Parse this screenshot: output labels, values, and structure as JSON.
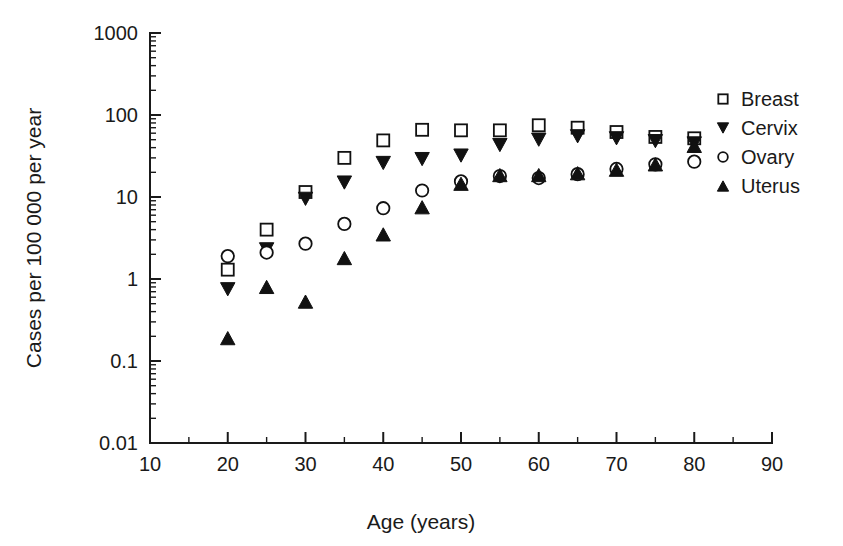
{
  "chart_data": {
    "type": "scatter",
    "title": "",
    "xlabel": "Age (years)",
    "ylabel": "Cases per 100 000 per year",
    "xlim": [
      10,
      90
    ],
    "ylim": [
      0.01,
      1000
    ],
    "yscale": "log",
    "xscale": "linear",
    "grid": false,
    "legend_position": "right",
    "x_ticks": [
      10,
      20,
      30,
      40,
      50,
      60,
      70,
      80,
      90
    ],
    "x_tick_labels": [
      "10",
      "20",
      "30",
      "40",
      "50",
      "60",
      "70",
      "80",
      "90"
    ],
    "x_minor_tick_step": 5,
    "y_ticks": [
      0.01,
      0.1,
      1,
      10,
      100,
      1000
    ],
    "y_tick_labels": [
      "0.01",
      "0.1",
      "1",
      "10",
      "100",
      "1000"
    ],
    "x": [
      20,
      25,
      30,
      35,
      40,
      45,
      50,
      55,
      60,
      65,
      70,
      75,
      80
    ],
    "series": [
      {
        "name": "Breast",
        "marker": "open-square",
        "color": "#111111",
        "values": [
          1.3,
          4.0,
          11.5,
          30.0,
          49.0,
          66.0,
          65.0,
          65.0,
          75.0,
          70.0,
          62.0,
          54.0,
          52.0
        ]
      },
      {
        "name": "Cervix",
        "marker": "filled-down-triangle",
        "color": "#111111",
        "values": [
          0.75,
          2.3,
          9.5,
          15.0,
          26.0,
          29.0,
          32.0,
          43.0,
          50.0,
          55.0,
          52.0,
          48.0,
          45.0
        ]
      },
      {
        "name": "Ovary",
        "marker": "open-circle",
        "color": "#111111",
        "values": [
          1.9,
          2.1,
          2.7,
          4.7,
          7.3,
          12.0,
          15.5,
          18.0,
          17.0,
          19.0,
          22.0,
          25.0,
          27.0
        ]
      },
      {
        "name": "Uterus",
        "marker": "filled-up-triangle",
        "color": "#111111",
        "values": [
          0.19,
          0.8,
          0.53,
          1.8,
          3.5,
          7.5,
          14.5,
          18.5,
          18.5,
          19.5,
          21.5,
          25.0,
          42.0
        ]
      }
    ]
  },
  "legend": {
    "entries": [
      {
        "label": "Breast",
        "marker": "open-square"
      },
      {
        "label": "Cervix",
        "marker": "filled-down-triangle"
      },
      {
        "label": "Ovary",
        "marker": "open-circle"
      },
      {
        "label": "Uterus",
        "marker": "filled-up-triangle"
      }
    ]
  },
  "axes": {
    "x_title": "Age (years)",
    "y_title": "Cases per 100 000 per year"
  }
}
